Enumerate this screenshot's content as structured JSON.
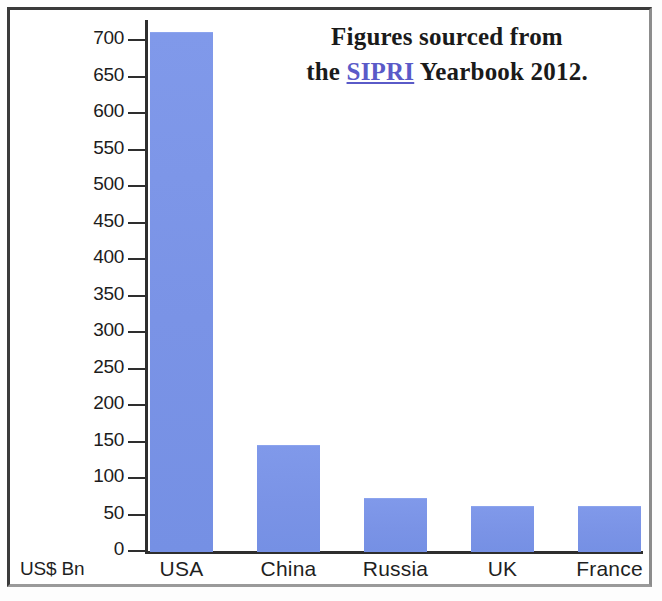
{
  "figure": {
    "name": "military-expenditure-bar-chart",
    "background_color": "#ffffff",
    "frame_color": "#3a3a3a"
  },
  "annotation": {
    "line1": "Figures sourced from",
    "line2_prefix": "the ",
    "link_text": "SIPRI",
    "line2_suffix": " Yearbook 2012.",
    "link_color": "#5a5ac8"
  },
  "axis": {
    "unit_label": "US$ Bn",
    "y_tick_labels": [
      "700",
      "650",
      "600",
      "550",
      "500",
      "450",
      "400",
      "350",
      "300",
      "250",
      "200",
      "150",
      "100",
      "50",
      "0"
    ],
    "x_tick_labels": [
      "USA",
      "China",
      "Russia",
      "UK",
      "France"
    ]
  },
  "chart_data": {
    "type": "bar",
    "title": "",
    "subtitle": "",
    "xlabel": "",
    "ylabel": "US$ Bn",
    "categories": [
      "USA",
      "China",
      "Russia",
      "UK",
      "France"
    ],
    "values": [
      711,
      145,
      72,
      62,
      62
    ],
    "series": [
      {
        "name": "Military expenditure 2011",
        "values": [
          711,
          145,
          72,
          62,
          62
        ],
        "color": "#7b96e8"
      }
    ],
    "ylim": [
      0,
      730
    ],
    "ytick_values": [
      0,
      50,
      100,
      150,
      200,
      250,
      300,
      350,
      400,
      450,
      500,
      550,
      600,
      650,
      700
    ],
    "ytick_step": 50,
    "grid": false,
    "legend": "none",
    "bar_color": "#7b96e8",
    "annotations": [
      "Figures sourced from the SIPRI Yearbook 2012."
    ]
  }
}
